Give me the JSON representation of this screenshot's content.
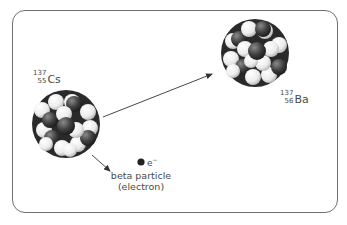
{
  "diagram": {
    "type": "beta-decay",
    "parent_nucleus": {
      "mass_number": "137",
      "atomic_number": "55",
      "symbol": "Cs"
    },
    "daughter_nucleus": {
      "mass_number": "137",
      "atomic_number": "56",
      "symbol": "Ba"
    },
    "emitted_particle": {
      "symbol": "e",
      "charge": "−",
      "caption_line1": "beta particle",
      "caption_line2": "(electron)"
    },
    "colors": {
      "frame": "#6f6f6f",
      "proton": "#3c3c3c",
      "neutron": "#f2f2f2",
      "arrow": "#333333",
      "text": "#4a4a4a"
    }
  }
}
